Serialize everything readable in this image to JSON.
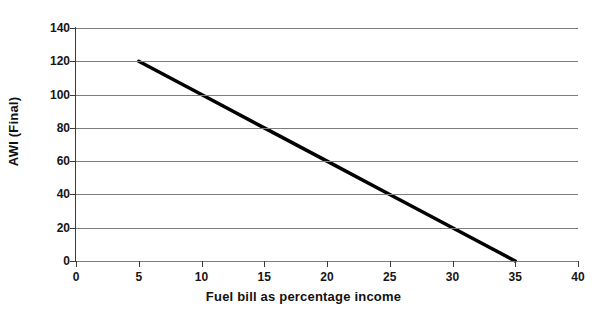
{
  "chart_data": {
    "type": "line",
    "title": "",
    "xlabel": "Fuel bill as percentage income",
    "ylabel": "AWI (Final)",
    "xlim": [
      0,
      40
    ],
    "ylim": [
      0,
      140
    ],
    "xticks": [
      0,
      5,
      10,
      15,
      20,
      25,
      30,
      35,
      40
    ],
    "yticks": [
      0,
      20,
      40,
      60,
      80,
      100,
      120,
      140
    ],
    "xtick_labels": [
      "0",
      "5",
      "10",
      "15",
      "20",
      "25",
      "30",
      "35",
      "40"
    ],
    "ytick_labels": [
      "0",
      "20",
      "40",
      "60",
      "80",
      "100",
      "120",
      "140"
    ],
    "grid": "horizontal",
    "legend": "none",
    "series": [
      {
        "name": "AWI (Final) vs fuel bill",
        "color": "#000000",
        "line_width": 3.5,
        "x": [
          5,
          10,
          15,
          20,
          25,
          30,
          35
        ],
        "values": [
          120,
          100,
          80,
          60,
          40,
          20,
          0
        ],
        "points": [
          {
            "x": 5,
            "y": 120
          },
          {
            "x": 10,
            "y": 100
          },
          {
            "x": 15,
            "y": 80
          },
          {
            "x": 20,
            "y": 60
          },
          {
            "x": 25,
            "y": 40
          },
          {
            "x": 30,
            "y": 20
          },
          {
            "x": 35,
            "y": 0
          }
        ],
        "slope": -4,
        "intercept": 140
      }
    ],
    "annotations": []
  },
  "axes": {
    "y_title": "AWI (Final)",
    "x_title": "Fuel bill as percentage income",
    "gridline_color": "#7d7d7d",
    "axis_color": "#3a3a3a",
    "background": "#ffffff"
  }
}
